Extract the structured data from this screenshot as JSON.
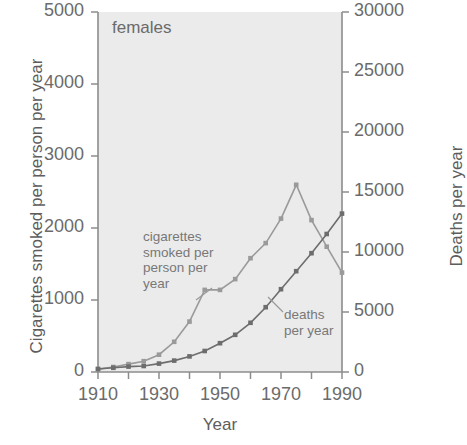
{
  "panel_title": "females",
  "axes": {
    "xlabel": "Year",
    "ylabel_left": "Cigarettes smoked per person per year",
    "ylabel_right": "Deaths per year",
    "xticks": [
      "1910",
      "1930",
      "1950",
      "1970",
      "1990"
    ],
    "yticks_left": [
      "0",
      "1000",
      "2000",
      "3000",
      "4000",
      "5000"
    ],
    "yticks_right": [
      "0",
      "5000",
      "10000",
      "15000",
      "20000",
      "25000",
      "30000"
    ]
  },
  "annotations": {
    "cigarettes": "cigarettes\nsmoked per\nperson per\nyear",
    "deaths": "deaths\nper year"
  },
  "colors": {
    "cigarettes_line": "#9a9a9a",
    "deaths_line": "#6d6d6d",
    "plot_background": "#ebebeb",
    "axis": "#8c8c8c",
    "text": "#6b6b6b"
  },
  "chart_data": {
    "type": "line",
    "title": "females",
    "xlabel": "Year",
    "ylabel": "Cigarettes smoked per person per year",
    "ylabel_secondary": "Deaths per year",
    "xlim": [
      1910,
      1990
    ],
    "ylim": [
      0,
      5000
    ],
    "ylim_secondary": [
      0,
      30000
    ],
    "grid": false,
    "legend": "inline-annotations",
    "series": [
      {
        "name": "cigarettes smoked per person per year",
        "axis": "left",
        "color": "#9a9a9a",
        "x": [
          1910,
          1915,
          1920,
          1925,
          1930,
          1935,
          1940,
          1945,
          1950,
          1955,
          1960,
          1965,
          1970,
          1975,
          1980,
          1985,
          1990
        ],
        "values": [
          40,
          70,
          110,
          150,
          240,
          420,
          700,
          1140,
          1140,
          1290,
          1580,
          1790,
          2130,
          2600,
          2110,
          1740,
          1380
        ]
      },
      {
        "name": "deaths per year",
        "axis": "right",
        "color": "#6d6d6d",
        "x": [
          1910,
          1915,
          1920,
          1925,
          1930,
          1935,
          1940,
          1945,
          1950,
          1955,
          1960,
          1965,
          1970,
          1975,
          1980,
          1985,
          1990
        ],
        "values": [
          250,
          350,
          450,
          500,
          700,
          950,
          1300,
          1750,
          2400,
          3100,
          4100,
          5400,
          6900,
          8400,
          9900,
          11500,
          13200
        ]
      }
    ]
  }
}
